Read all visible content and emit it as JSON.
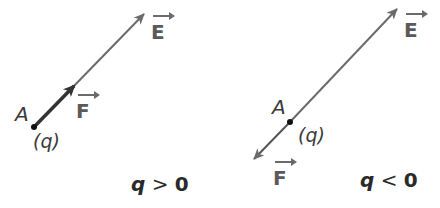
{
  "panels": [
    {
      "point_label": "A",
      "charge_label": "(q)",
      "force_label": "F",
      "field_label": "E",
      "condition": {
        "var": "q",
        "op": ">",
        "value": "0"
      }
    },
    {
      "point_label": "A",
      "charge_label": "(q)",
      "force_label": "F",
      "field_label": "E",
      "condition": {
        "var": "q",
        "op": "<",
        "value": "0"
      }
    }
  ],
  "colors": {
    "field_line": "#6b6b6b",
    "force_arrow": "#3a3a3a",
    "text": "#3a3a3a"
  }
}
